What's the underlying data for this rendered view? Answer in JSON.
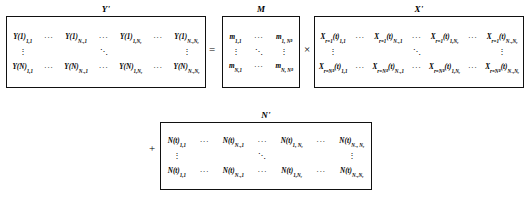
{
  "equation": {
    "description": "Y' = M x X' + N'",
    "operators": {
      "equals": "=",
      "times": "×",
      "plus": "+"
    },
    "ellipsis": {
      "horizontal": "···",
      "vertical": "⋮",
      "diagonal": "⋱"
    }
  },
  "matrices": {
    "y": {
      "label": "Y'",
      "rows": [
        {
          "cells": [
            {
              "base": "Y(1)",
              "sub": "1,1"
            },
            {
              "base": "···",
              "sub": ""
            },
            {
              "base": "Y(1)",
              "sub": "Nₓ,1"
            },
            {
              "base": "···",
              "sub": ""
            },
            {
              "base": "Y(1)",
              "sub": "1,Nᵧ"
            },
            {
              "base": "···",
              "sub": ""
            },
            {
              "base": "Y(1)",
              "sub": "Nₓ,Nᵧ"
            }
          ]
        },
        {
          "cells": [
            {
              "base": "⋮",
              "sub": ""
            },
            {
              "base": "",
              "sub": ""
            },
            {
              "base": "",
              "sub": ""
            },
            {
              "base": "⋱",
              "sub": ""
            },
            {
              "base": "",
              "sub": ""
            },
            {
              "base": "",
              "sub": ""
            },
            {
              "base": "⋮",
              "sub": ""
            }
          ]
        },
        {
          "cells": [
            {
              "base": "Y(N)",
              "sub": "1,1"
            },
            {
              "base": "···",
              "sub": ""
            },
            {
              "base": "Y(N)",
              "sub": "Nₓ,1"
            },
            {
              "base": "···",
              "sub": ""
            },
            {
              "base": "Y(N)",
              "sub": "1,Nᵧ"
            },
            {
              "base": "···",
              "sub": ""
            },
            {
              "base": "Y(N)",
              "sub": "Nₓ,Nᵧ"
            }
          ]
        }
      ]
    },
    "m": {
      "label": "M",
      "rows": [
        {
          "cells": [
            {
              "base": "m",
              "sub": "1,1"
            },
            {
              "base": "···",
              "sub": ""
            },
            {
              "base": "m",
              "sub": "1, Nᴿ"
            }
          ]
        },
        {
          "cells": [
            {
              "base": "⋮",
              "sub": ""
            },
            {
              "base": "⋱",
              "sub": ""
            },
            {
              "base": "⋮",
              "sub": ""
            }
          ]
        },
        {
          "cells": [
            {
              "base": "m",
              "sub": "N,1"
            },
            {
              "base": "···",
              "sub": ""
            },
            {
              "base": "m",
              "sub": "N, Nᴿ"
            }
          ]
        }
      ]
    },
    "x": {
      "label": "X'",
      "rows": [
        {
          "cells": [
            {
              "base": "X",
              "sub2": "r=1",
              "mid": "(t)",
              "sub": "1,1"
            },
            {
              "base": "···",
              "sub2": "",
              "mid": "",
              "sub": ""
            },
            {
              "base": "X",
              "sub2": "r=1",
              "mid": "(t)",
              "sub": "Nₓ,1"
            },
            {
              "base": "···",
              "sub2": "",
              "mid": "",
              "sub": ""
            },
            {
              "base": "X",
              "sub2": "r=1",
              "mid": "(t)",
              "sub": "1,Nᵧ"
            },
            {
              "base": "···",
              "sub2": "",
              "mid": "",
              "sub": ""
            },
            {
              "base": "X",
              "sub2": "r=1",
              "mid": "(t)",
              "sub": "Nₓ,Nᵧ"
            }
          ]
        },
        {
          "cells": [
            {
              "base": "⋮",
              "sub2": "",
              "mid": "",
              "sub": ""
            },
            {
              "base": "",
              "sub2": "",
              "mid": "",
              "sub": ""
            },
            {
              "base": "",
              "sub2": "",
              "mid": "",
              "sub": ""
            },
            {
              "base": "⋱",
              "sub2": "",
              "mid": "",
              "sub": ""
            },
            {
              "base": "",
              "sub2": "",
              "mid": "",
              "sub": ""
            },
            {
              "base": "",
              "sub2": "",
              "mid": "",
              "sub": ""
            },
            {
              "base": "⋮",
              "sub2": "",
              "mid": "",
              "sub": ""
            }
          ]
        },
        {
          "cells": [
            {
              "base": "X",
              "sub2": "r=Nᴿ",
              "mid": "(t)",
              "sub": "1,1"
            },
            {
              "base": "···",
              "sub2": "",
              "mid": "",
              "sub": ""
            },
            {
              "base": "X",
              "sub2": "r=Nᴿ",
              "mid": "(t)",
              "sub": "Nₓ,1"
            },
            {
              "base": "···",
              "sub2": "",
              "mid": "",
              "sub": ""
            },
            {
              "base": "X",
              "sub2": "r=Nᴿ",
              "mid": "(t)",
              "sub": "1,Nᵧ"
            },
            {
              "base": "···",
              "sub2": "",
              "mid": "",
              "sub": ""
            },
            {
              "base": "X",
              "sub2": "r=Nᴿ",
              "mid": "(t)",
              "sub": "Nₓ,Nᵧ"
            }
          ]
        }
      ]
    },
    "n": {
      "label": "N'",
      "rows": [
        {
          "cells": [
            {
              "base": "N(t)",
              "sub": "1,1"
            },
            {
              "base": "···",
              "sub": ""
            },
            {
              "base": "N(t)",
              "sub": "Nₓ,1"
            },
            {
              "base": "···",
              "sub": ""
            },
            {
              "base": "N(t)",
              "sub": "1, Nᵧ"
            },
            {
              "base": "···",
              "sub": ""
            },
            {
              "base": "N(t)",
              "sub": "Nₓ, Nᵧ"
            }
          ]
        },
        {
          "cells": [
            {
              "base": "⋮",
              "sub": ""
            },
            {
              "base": "",
              "sub": ""
            },
            {
              "base": "",
              "sub": ""
            },
            {
              "base": "⋱",
              "sub": ""
            },
            {
              "base": "",
              "sub": ""
            },
            {
              "base": "",
              "sub": ""
            },
            {
              "base": "⋮",
              "sub": ""
            }
          ]
        },
        {
          "cells": [
            {
              "base": "N(t)",
              "sub": "1,1"
            },
            {
              "base": "···",
              "sub": ""
            },
            {
              "base": "N(t)",
              "sub": "Nₓ,1"
            },
            {
              "base": "···",
              "sub": ""
            },
            {
              "base": "N(t)",
              "sub": "1,Nᵧ"
            },
            {
              "base": "···",
              "sub": ""
            },
            {
              "base": "N(t)",
              "sub": "Nₓ,Nᵧ"
            }
          ]
        }
      ]
    }
  }
}
